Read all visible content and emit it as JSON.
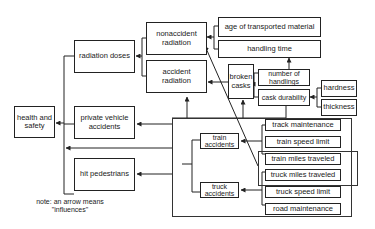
{
  "diagram": {
    "type": "influence-diagram",
    "nodes": {
      "health_and_safety": "health and safety",
      "radiation_doses": "radiation doses",
      "private_vehicle_accidents": "private vehicle accidents",
      "hit_pedestrians": "hit pedestrians",
      "nonaccident_radiation": "nonaccident radiation",
      "accident_radiation": "accident radiation",
      "age_of_transported_material": "age of transported material",
      "handling_time": "handling time",
      "broken_casks": "broken casks",
      "number_of_handlings": "number of handlings",
      "cask_durability": "cask durability",
      "hardness": "hardness",
      "thickness": "thickness",
      "train_accidents": "train accidents",
      "truck_accidents": "truck accidents",
      "track_maintenance": "track maintenance",
      "train_speed_limit": "train speed limit",
      "train_miles_traveled": "train miles traveled",
      "truck_miles_traveled": "truck miles traveled",
      "truck_speed_limit": "truck speed limit",
      "road_maintenance": "road maintenance"
    },
    "note": {
      "line1": "note: an arrow means",
      "line2": "\"influences\""
    },
    "edges": [
      [
        "radiation doses",
        "health and safety"
      ],
      [
        "private vehicle accidents",
        "health and safety"
      ],
      [
        "hit pedestrians",
        "health and safety"
      ],
      [
        "nonaccident radiation",
        "radiation doses"
      ],
      [
        "accident radiation",
        "radiation doses"
      ],
      [
        "age of transported material",
        "nonaccident radiation"
      ],
      [
        "handling time",
        "nonaccident radiation"
      ],
      [
        "number of handlings",
        "handling time"
      ],
      [
        "broken casks",
        "accident radiation"
      ],
      [
        "number of handlings",
        "broken casks"
      ],
      [
        "cask durability",
        "broken casks"
      ],
      [
        "hardness",
        "cask durability"
      ],
      [
        "thickness",
        "cask durability"
      ],
      [
        "track maintenance",
        "train accidents"
      ],
      [
        "train speed limit",
        "train accidents"
      ],
      [
        "train miles traveled",
        "train accidents"
      ],
      [
        "truck miles traveled",
        "truck accidents"
      ],
      [
        "truck speed limit",
        "truck accidents"
      ],
      [
        "road maintenance",
        "truck accidents"
      ],
      [
        "truck miles traveled",
        "nonaccident radiation"
      ],
      [
        "accident group",
        "accident radiation"
      ],
      [
        "accident group",
        "broken casks"
      ],
      [
        "accident group",
        "private vehicle accidents"
      ],
      [
        "accident group",
        "health and safety"
      ],
      [
        "accident group",
        "hit pedestrians"
      ]
    ]
  }
}
